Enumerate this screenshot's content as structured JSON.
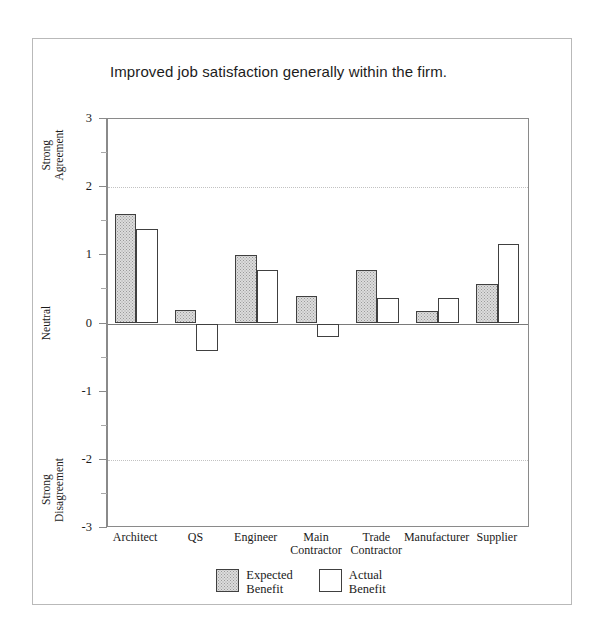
{
  "chart_data": {
    "type": "bar",
    "title": "Improved job satisfaction generally within the firm.",
    "xlabel": "",
    "ylabel": "",
    "ylim": [
      -3,
      3
    ],
    "yticks": [
      3,
      2,
      1,
      0,
      -1,
      -2,
      -3
    ],
    "ytick_labels": [
      "3",
      "2",
      "1",
      "0",
      "-1",
      "-2",
      "-3"
    ],
    "grid": "dotted horizontal gridlines at +2 and -2, solid zero line",
    "legend_position": "bottom-center",
    "categories": [
      "Architect",
      "QS",
      "Engineer",
      "Main Contractor",
      "Trade Contractor",
      "Manufacturer",
      "Supplier"
    ],
    "category_lines": [
      [
        "Architect"
      ],
      [
        "QS"
      ],
      [
        "Engineer"
      ],
      [
        "Main",
        "Contractor"
      ],
      [
        "Trade",
        "Contractor"
      ],
      [
        "Manufacturer"
      ],
      [
        "Supplier"
      ]
    ],
    "series": [
      {
        "name": "Expected Benefit",
        "name_lines": [
          "Expected",
          "Benefit"
        ],
        "fill": "stippled-grey",
        "values": [
          1.6,
          0.2,
          1.0,
          0.4,
          0.78,
          0.18,
          0.58
        ]
      },
      {
        "name": "Actual Benefit",
        "name_lines": [
          "Actual",
          "Benefit"
        ],
        "fill": "white",
        "values": [
          1.39,
          -0.41,
          0.78,
          -0.2,
          0.38,
          0.38,
          1.17
        ]
      }
    ],
    "axis_annotations": [
      {
        "text": "Strong Agreement",
        "lines": [
          "Strong",
          "Agreement"
        ],
        "at_value": 2.45,
        "rotation": -90
      },
      {
        "text": "Neutral",
        "lines": [
          "Neutral"
        ],
        "at_value": 0.0,
        "rotation": -90
      },
      {
        "text": "Strong Disagreement",
        "lines": [
          "Strong",
          "Disagreement"
        ],
        "at_value": -2.45,
        "rotation": -90
      }
    ]
  },
  "colors": {
    "expected_fill": "#dcdcdc",
    "actual_fill": "#ffffff",
    "bar_outline": "#404040",
    "axis": "#8a8a8a",
    "gridline": "#c2c2c2",
    "text": "#1a1a1a"
  }
}
